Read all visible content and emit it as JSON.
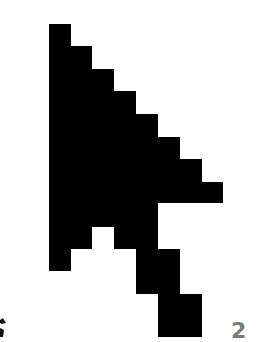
{
  "image": {
    "subject": "pixelated mouse cursor arrow",
    "fill_color": "#000000",
    "background_color": "#ffffff"
  },
  "fragments": {
    "right_text": "2",
    "right_text_color": "#7a7a7a"
  }
}
